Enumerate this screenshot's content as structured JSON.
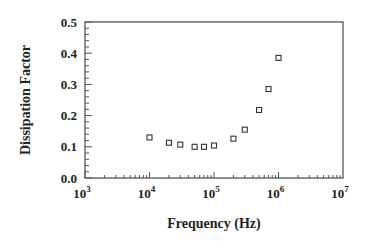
{
  "chart_data": {
    "type": "scatter",
    "title": "",
    "xlabel": "Frequency (Hz)",
    "ylabel": "Dissipation Factor",
    "xscale": "log",
    "xlim": [
      1000,
      10000000
    ],
    "ylim": [
      0.0,
      0.5
    ],
    "grid": false,
    "legend": null,
    "x_ticks": [
      {
        "base": "10",
        "exp": "3",
        "value": 1000
      },
      {
        "base": "10",
        "exp": "4",
        "value": 10000
      },
      {
        "base": "10",
        "exp": "5",
        "value": 100000
      },
      {
        "base": "10",
        "exp": "6",
        "value": 1000000
      },
      {
        "base": "10",
        "exp": "7",
        "value": 10000000
      }
    ],
    "y_ticks": [
      {
        "label": "0.0",
        "value": 0.0
      },
      {
        "label": "0.1",
        "value": 0.1
      },
      {
        "label": "0.2",
        "value": 0.2
      },
      {
        "label": "0.3",
        "value": 0.3
      },
      {
        "label": "0.4",
        "value": 0.4
      },
      {
        "label": "0.5",
        "value": 0.5
      }
    ],
    "series": [
      {
        "name": "Dissipation Factor",
        "marker": "open-square",
        "points": [
          {
            "x": 10000,
            "y": 0.13
          },
          {
            "x": 20000,
            "y": 0.113
          },
          {
            "x": 30000,
            "y": 0.107
          },
          {
            "x": 50000,
            "y": 0.1
          },
          {
            "x": 70000,
            "y": 0.1
          },
          {
            "x": 100000,
            "y": 0.104
          },
          {
            "x": 200000,
            "y": 0.126
          },
          {
            "x": 300000,
            "y": 0.155
          },
          {
            "x": 500000,
            "y": 0.218
          },
          {
            "x": 700000,
            "y": 0.285
          },
          {
            "x": 1000000,
            "y": 0.385
          }
        ]
      }
    ]
  },
  "colors": {
    "axis": "#555555",
    "marker": "#333333"
  }
}
